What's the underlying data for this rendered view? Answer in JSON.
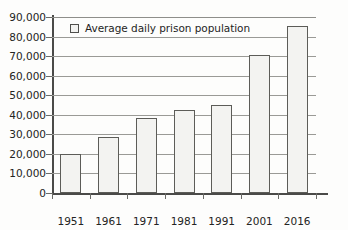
{
  "chart_data": {
    "type": "bar",
    "title": "",
    "xlabel": "",
    "ylabel": "",
    "categories": [
      "1951",
      "1961",
      "1971",
      "1981",
      "1991",
      "2001",
      "2016"
    ],
    "values": [
      20000,
      28500,
      38500,
      42500,
      45000,
      70500,
      85500
    ],
    "series": [
      {
        "name": "Average daily prison population",
        "values": [
          20000,
          28500,
          38500,
          42500,
          45000,
          70500,
          85500
        ]
      }
    ],
    "ylim": [
      0,
      90000
    ],
    "ytick_values": [
      0,
      10000,
      20000,
      30000,
      40000,
      50000,
      60000,
      70000,
      80000,
      90000
    ],
    "ytick_labels": [
      "0",
      "10,000",
      "20,000",
      "30,000",
      "40,000",
      "50,000",
      "60,000",
      "70,000",
      "80,000",
      "90,000"
    ],
    "grid": "horizontal",
    "legend_position": "top-left",
    "legend": [
      "Average daily prison population"
    ],
    "bar_fill_color": "#f3f3f1",
    "bar_border_color": "#5c5c58",
    "gridline_color": "#9a9a96",
    "axis_color": "#4a4a48",
    "background_color": "#fdfdfc"
  }
}
